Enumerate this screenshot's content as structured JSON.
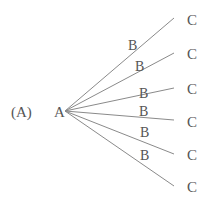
{
  "diagram": {
    "label": "(A)",
    "root": {
      "name": "A",
      "x": 54,
      "y": 117
    },
    "origin": {
      "x": 65,
      "y": 111
    },
    "colors": {
      "line": "#8a8a8a",
      "text": "#555555"
    },
    "branches": [
      {
        "mid_label": "B",
        "leaf_label": "C",
        "end": {
          "x": 174,
          "y": 18
        },
        "mid": {
          "x": 128,
          "y": 50
        },
        "leaf": {
          "x": 187,
          "y": 25
        }
      },
      {
        "mid_label": "B",
        "leaf_label": "C",
        "end": {
          "x": 174,
          "y": 53
        },
        "mid": {
          "x": 135,
          "y": 71
        },
        "leaf": {
          "x": 187,
          "y": 59
        }
      },
      {
        "mid_label": "B",
        "leaf_label": "C",
        "end": {
          "x": 174,
          "y": 88
        },
        "mid": {
          "x": 139,
          "y": 98
        },
        "leaf": {
          "x": 187,
          "y": 94
        }
      },
      {
        "mid_label": "B",
        "leaf_label": "C",
        "end": {
          "x": 174,
          "y": 120
        },
        "mid": {
          "x": 139,
          "y": 116
        },
        "leaf": {
          "x": 187,
          "y": 127
        }
      },
      {
        "mid_label": "B",
        "leaf_label": "C",
        "end": {
          "x": 174,
          "y": 154
        },
        "mid": {
          "x": 140,
          "y": 137
        },
        "leaf": {
          "x": 187,
          "y": 160
        }
      },
      {
        "mid_label": "B",
        "leaf_label": "C",
        "end": {
          "x": 174,
          "y": 186
        },
        "mid": {
          "x": 140,
          "y": 160
        },
        "leaf": {
          "x": 187,
          "y": 192
        }
      }
    ]
  }
}
